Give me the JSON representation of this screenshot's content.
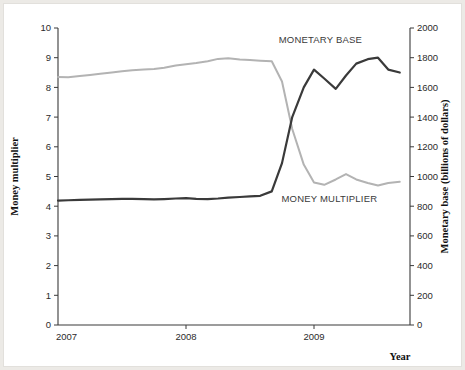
{
  "figure": {
    "background_color": "#ffffff",
    "page_color": "#eceae6"
  },
  "chart_data": {
    "type": "line",
    "title": "",
    "subtitle": "",
    "xlabel": "Year",
    "grid": false,
    "legend_position": "inline-annotations",
    "x_axis": {
      "label": "Year",
      "ticks": [
        "2007",
        "2008",
        "2009"
      ],
      "tick_values": [
        2007,
        2008,
        2009
      ],
      "range": [
        2007.0,
        2009.75
      ]
    },
    "y_axis_left": {
      "label": "Money multiplier",
      "ticks": [
        "0",
        "1",
        "2",
        "3",
        "4",
        "5",
        "6",
        "7",
        "8",
        "9",
        "10"
      ],
      "tick_values": [
        0,
        1,
        2,
        3,
        4,
        5,
        6,
        7,
        8,
        9,
        10
      ],
      "ylim": [
        0,
        10
      ]
    },
    "y_axis_right": {
      "label": "Monetary base (billions of dollars)",
      "ticks": [
        "0",
        "200",
        "400",
        "600",
        "800",
        "1000",
        "1200",
        "1400",
        "1600",
        "1800",
        "2000"
      ],
      "tick_values": [
        0,
        200,
        400,
        600,
        800,
        1000,
        1200,
        1400,
        1600,
        1800,
        2000
      ],
      "ylim": [
        0,
        2000
      ]
    },
    "series": [
      {
        "name": "MONEY MULTIPLIER",
        "axis": "left",
        "color": "#b3b3b3",
        "annotation_label": "MONEY MULTIPLIER",
        "x": [
          2007.0,
          2007.08,
          2007.17,
          2007.25,
          2007.33,
          2007.42,
          2007.5,
          2007.58,
          2007.67,
          2007.75,
          2007.83,
          2007.92,
          2008.0,
          2008.08,
          2008.17,
          2008.25,
          2008.33,
          2008.42,
          2008.5,
          2008.58,
          2008.67,
          2008.75,
          2008.83,
          2008.92,
          2009.0,
          2009.08,
          2009.17,
          2009.25,
          2009.33,
          2009.42,
          2009.5,
          2009.58,
          2009.67
        ],
        "values": [
          8.35,
          8.34,
          8.38,
          8.42,
          8.46,
          8.5,
          8.54,
          8.58,
          8.6,
          8.62,
          8.66,
          8.74,
          8.78,
          8.82,
          8.88,
          8.96,
          8.98,
          8.94,
          8.92,
          8.9,
          8.88,
          8.2,
          6.6,
          5.4,
          4.8,
          4.72,
          4.9,
          5.08,
          4.9,
          4.78,
          4.7,
          4.78,
          4.82
        ]
      },
      {
        "name": "MONETARY BASE",
        "axis": "right",
        "color": "#3a3a3a",
        "annotation_label": "MONETARY BASE",
        "x": [
          2007.0,
          2007.08,
          2007.17,
          2007.25,
          2007.33,
          2007.42,
          2007.5,
          2007.58,
          2007.67,
          2007.75,
          2007.83,
          2007.92,
          2008.0,
          2008.08,
          2008.17,
          2008.25,
          2008.33,
          2008.42,
          2008.5,
          2008.58,
          2008.67,
          2008.75,
          2008.83,
          2008.92,
          2009.0,
          2009.08,
          2009.17,
          2009.25,
          2009.33,
          2009.42,
          2009.5,
          2009.58,
          2009.67
        ],
        "values": [
          838,
          840,
          842,
          844,
          846,
          848,
          850,
          850,
          848,
          846,
          848,
          852,
          854,
          850,
          848,
          852,
          858,
          862,
          866,
          870,
          900,
          1090,
          1400,
          1600,
          1720,
          1660,
          1590,
          1680,
          1760,
          1790,
          1800,
          1720,
          1700
        ]
      }
    ],
    "annotations": [
      {
        "text": "MONETARY BASE",
        "x": 2009.05,
        "y_right": 1900
      },
      {
        "text": "MONEY MULTIPLIER",
        "x": 2009.12,
        "y_left": 4.15
      }
    ]
  }
}
